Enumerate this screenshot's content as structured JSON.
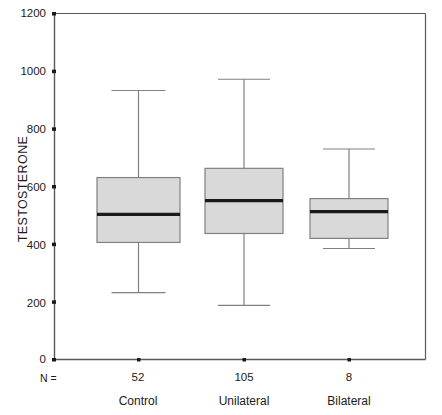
{
  "chart_data": {
    "type": "box",
    "title": "",
    "xlabel": "",
    "ylabel": "TESTOSTERONE",
    "ylim": [
      0,
      1200
    ],
    "yticks": [
      0,
      200,
      400,
      600,
      800,
      1000,
      1200
    ],
    "ytick_labels": [
      "0",
      "200",
      "400",
      "600",
      "800",
      "1000",
      "1200"
    ],
    "grid": false,
    "legend": "none",
    "categories": [
      "Control",
      "Unilateral",
      "Bilateral"
    ],
    "n_label": "N =",
    "n_values": [
      "52",
      "105",
      "8"
    ],
    "boxes": [
      {
        "category": "Control",
        "n": 52,
        "whisker_low": 232,
        "q1": 406,
        "median": 503,
        "q3": 631,
        "whisker_high": 933
      },
      {
        "category": "Unilateral",
        "n": 105,
        "whisker_low": 188,
        "q1": 437,
        "median": 551,
        "q3": 663,
        "whisker_high": 972
      },
      {
        "category": "Bilateral",
        "n": 8,
        "whisker_low": 385,
        "q1": 420,
        "median": 513,
        "q3": 558,
        "whisker_high": 730
      }
    ],
    "colors": {
      "box_fill": "#d9d9d9",
      "box_edge": "#808080",
      "median": "#1a1a1a",
      "whisker": "#808080",
      "axis": "#595959",
      "background": "#ffffff"
    }
  }
}
